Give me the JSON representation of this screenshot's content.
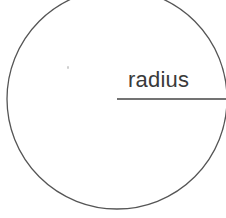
{
  "diagram": {
    "circle": {
      "cx": 117,
      "cy": 99,
      "r": 110,
      "stroke": "#555555",
      "stroke_width": 1.3
    },
    "radius_line": {
      "x1": 117,
      "y1": 99,
      "x2": 226,
      "y2": 99,
      "stroke": "#444444",
      "stroke_width": 1.3
    },
    "label": "radius"
  }
}
